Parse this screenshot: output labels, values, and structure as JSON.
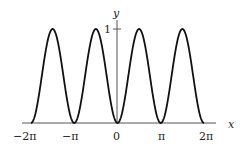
{
  "chart_data": {
    "type": "line",
    "title": "",
    "function": "y = sin^2(x)",
    "xlabel": "x",
    "ylabel": "y",
    "xlim": [
      -6.2832,
      6.2832
    ],
    "ylim": [
      0,
      1
    ],
    "x_ticks": [
      "-2π",
      "-π",
      "0",
      "π",
      "2π"
    ],
    "x_tick_values": [
      -6.2832,
      -3.1416,
      0,
      3.1416,
      6.2832
    ],
    "y_ticks": [
      "1"
    ],
    "y_tick_values": [
      1
    ],
    "grid": false,
    "legend": null,
    "series": [
      {
        "name": "sin^2(x)",
        "x": [
          -6.2832,
          -5.4978,
          -4.7124,
          -3.927,
          -3.1416,
          -2.3562,
          -1.5708,
          -0.7854,
          0,
          0.7854,
          1.5708,
          2.3562,
          3.1416,
          3.927,
          4.7124,
          5.4978,
          6.2832
        ],
        "values": [
          0,
          0.5,
          1,
          0.5,
          0,
          0.5,
          1,
          0.5,
          0,
          0.5,
          1,
          0.5,
          0,
          0.5,
          1,
          0.5,
          0
        ]
      }
    ]
  },
  "labels": {
    "x_axis": "x",
    "y_axis": "y",
    "tick_neg2pi": "−2π",
    "tick_negpi": "−π",
    "tick_zero": "0",
    "tick_pi": "π",
    "tick_2pi": "2π",
    "tick_y1": "1"
  }
}
